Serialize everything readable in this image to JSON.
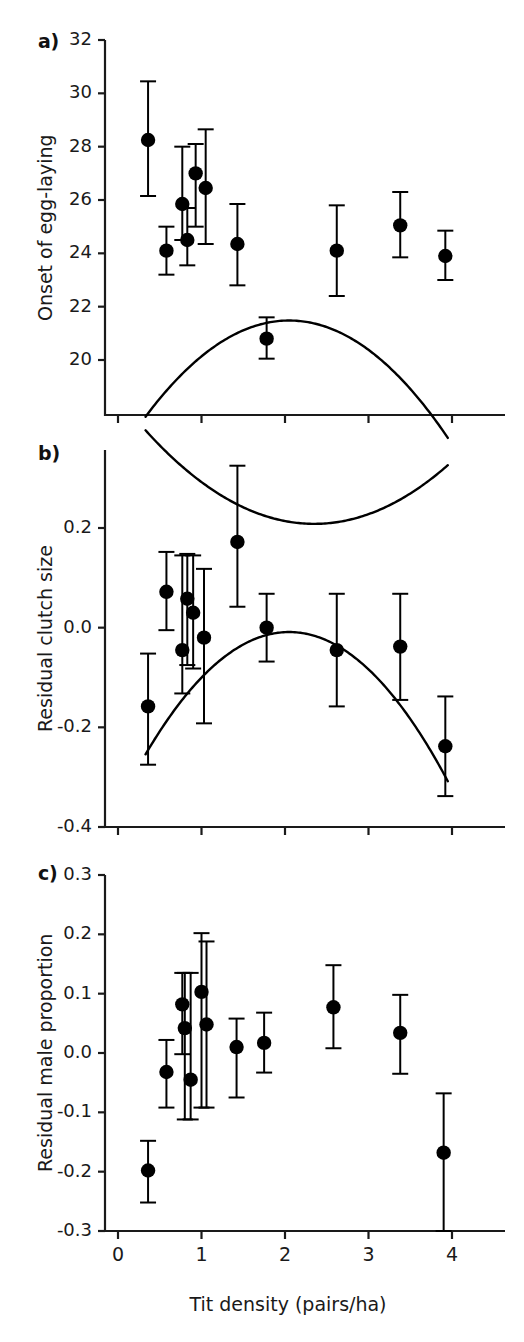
{
  "figure": {
    "xlabel": "Tit density (pairs/ha)",
    "panel_a_letter": "a)",
    "panel_b_letter": "b)",
    "panel_c_letter": "c)",
    "marker_color": "#000000",
    "line_color": "#000000",
    "axis_color": "#1a1a1a",
    "background": "#ffffff"
  },
  "chart_data": [
    {
      "type": "scatter",
      "panel": "a",
      "title": "",
      "xlabel": "Tit density (pairs/ha)",
      "ylabel": "Onset of egg-laying",
      "xlim": [
        -0.22,
        4.44
      ],
      "ylim": [
        19.2,
        32.0
      ],
      "xticks": [
        0,
        1,
        2,
        3,
        4
      ],
      "xticklabels": [
        "0",
        "1",
        "2",
        "3",
        "4"
      ],
      "yticks": [
        20,
        22,
        24,
        26,
        28,
        30,
        32
      ],
      "yticklabels": [
        "20",
        "22",
        "24",
        "26",
        "28",
        "30",
        "32"
      ],
      "grid": false,
      "legend": "none",
      "fit": {
        "type": "quadratic",
        "vertex_x": 2.35,
        "vertex_y": 23.35,
        "x_start": 0.33,
        "x_end": 3.95
      },
      "points": [
        {
          "x": 0.36,
          "y": 28.25,
          "err_low": 26.15,
          "err_high": 30.45
        },
        {
          "x": 0.58,
          "y": 24.1,
          "err_low": 23.2,
          "err_high": 25.0
        },
        {
          "x": 0.77,
          "y": 25.85,
          "err_low": 24.5,
          "err_high": 28.0
        },
        {
          "x": 0.83,
          "y": 24.5,
          "err_low": 23.55,
          "err_high": 25.7
        },
        {
          "x": 0.93,
          "y": 27.0,
          "err_low": 25.0,
          "err_high": 28.1
        },
        {
          "x": 1.05,
          "y": 26.45,
          "err_low": 24.35,
          "err_high": 28.65
        },
        {
          "x": 1.43,
          "y": 24.35,
          "err_low": 22.8,
          "err_high": 25.85
        },
        {
          "x": 1.78,
          "y": 20.8,
          "err_low": 20.05,
          "err_high": 21.6
        },
        {
          "x": 2.62,
          "y": 24.1,
          "err_low": 22.4,
          "err_high": 25.8
        },
        {
          "x": 3.38,
          "y": 25.05,
          "err_low": 23.85,
          "err_high": 26.3
        },
        {
          "x": 3.92,
          "y": 23.9,
          "err_low": 23.0,
          "err_high": 24.85
        }
      ]
    },
    {
      "type": "scatter",
      "panel": "b",
      "title": "",
      "xlabel": "Tit density (pairs/ha)",
      "ylabel": "Residual clutch size",
      "xlim": [
        -0.22,
        4.44
      ],
      "ylim": [
        -0.4,
        0.34
      ],
      "xticks": [
        0,
        1,
        2,
        3,
        4
      ],
      "xticklabels": [
        "0",
        "1",
        "2",
        "3",
        "4"
      ],
      "yticks": [
        -0.4,
        -0.2,
        0.0,
        0.2
      ],
      "yticklabels": [
        "-0.4",
        "-0.2",
        "0.0",
        "0.2"
      ],
      "grid": false,
      "legend": "none",
      "fit": {
        "type": "quadratic",
        "vertex_x": 2.05,
        "vertex_y": 0.068,
        "x_start": 0.33,
        "x_end": 3.95
      },
      "points": [
        {
          "x": 0.36,
          "y": -0.158,
          "err_low": -0.275,
          "err_high": -0.052
        },
        {
          "x": 0.58,
          "y": 0.072,
          "err_low": -0.005,
          "err_high": 0.152
        },
        {
          "x": 0.77,
          "y": -0.045,
          "err_low": -0.132,
          "err_high": 0.145
        },
        {
          "x": 0.83,
          "y": 0.058,
          "err_low": -0.075,
          "err_high": 0.148
        },
        {
          "x": 0.9,
          "y": 0.03,
          "err_low": -0.082,
          "err_high": 0.145
        },
        {
          "x": 1.03,
          "y": -0.02,
          "err_low": -0.192,
          "err_high": 0.118
        },
        {
          "x": 1.43,
          "y": 0.172,
          "err_low": 0.042,
          "err_high": 0.325
        },
        {
          "x": 1.78,
          "y": 0.0,
          "err_low": -0.068,
          "err_high": 0.068
        },
        {
          "x": 2.62,
          "y": -0.045,
          "err_low": -0.158,
          "err_high": 0.068
        },
        {
          "x": 3.38,
          "y": -0.038,
          "err_low": -0.145,
          "err_high": 0.068
        },
        {
          "x": 3.92,
          "y": -0.238,
          "err_low": -0.338,
          "err_high": -0.138
        }
      ]
    },
    {
      "type": "scatter",
      "panel": "c",
      "title": "",
      "xlabel": "Tit density (pairs/ha)",
      "ylabel": "Residual male proportion",
      "xlim": [
        -0.22,
        4.44
      ],
      "ylim": [
        -0.3,
        0.3
      ],
      "xticks": [
        0,
        1,
        2,
        3,
        4
      ],
      "xticklabels": [
        "0",
        "1",
        "2",
        "3",
        "4"
      ],
      "yticks": [
        -0.3,
        -0.2,
        -0.1,
        0.0,
        0.1,
        0.2,
        0.3
      ],
      "yticklabels": [
        "-0.3",
        "-0.2",
        "-0.1",
        "0.0",
        "0.1",
        "0.2",
        "0.3"
      ],
      "grid": false,
      "legend": "none",
      "fit": {
        "type": "quadratic",
        "vertex_x": 2.05,
        "vertex_y": 0.124,
        "x_start": 0.33,
        "x_end": 3.95
      },
      "points": [
        {
          "x": 0.36,
          "y": -0.198,
          "err_low": -0.252,
          "err_high": -0.148
        },
        {
          "x": 0.58,
          "y": -0.032,
          "err_low": -0.092,
          "err_high": 0.022
        },
        {
          "x": 0.77,
          "y": 0.082,
          "err_low": -0.002,
          "err_high": 0.135
        },
        {
          "x": 0.8,
          "y": 0.042,
          "err_low": -0.112,
          "err_high": 0.135
        },
        {
          "x": 0.87,
          "y": -0.045,
          "err_low": -0.112,
          "err_high": 0.135
        },
        {
          "x": 1.0,
          "y": 0.103,
          "err_low": -0.092,
          "err_high": 0.202
        },
        {
          "x": 1.06,
          "y": 0.048,
          "err_low": -0.092,
          "err_high": 0.188
        },
        {
          "x": 1.42,
          "y": 0.01,
          "err_low": -0.075,
          "err_high": 0.058
        },
        {
          "x": 1.75,
          "y": 0.017,
          "err_low": -0.033,
          "err_high": 0.068
        },
        {
          "x": 2.58,
          "y": 0.077,
          "err_low": 0.008,
          "err_high": 0.148
        },
        {
          "x": 3.38,
          "y": 0.034,
          "err_low": -0.035,
          "err_high": 0.098
        },
        {
          "x": 3.9,
          "y": -0.168,
          "err_low": -0.3,
          "err_high": -0.068
        }
      ]
    }
  ]
}
